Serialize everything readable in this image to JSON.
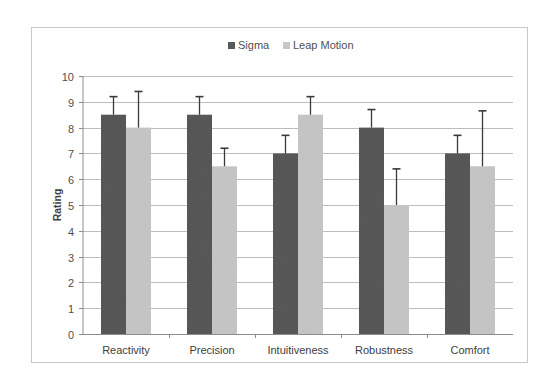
{
  "chart_data": {
    "type": "bar",
    "title": "",
    "xlabel": "",
    "ylabel": "Rating",
    "ylim": [
      0,
      10
    ],
    "yticks": [
      0,
      1,
      2,
      3,
      4,
      5,
      6,
      7,
      8,
      9,
      10
    ],
    "grid": true,
    "legend_position": "top",
    "categories": [
      "Reactivity",
      "Precision",
      "Intuitiveness",
      "Robustness",
      "Comfort"
    ],
    "series": [
      {
        "name": "Sigma",
        "color": "#595959",
        "values": [
          8.5,
          8.5,
          7.0,
          8.0,
          7.0
        ],
        "error_plus": [
          0.7,
          0.7,
          0.7,
          0.7,
          0.7
        ]
      },
      {
        "name": "Leap Motion",
        "color": "#c8c8c8",
        "values": [
          8.0,
          6.5,
          8.5,
          5.0,
          6.5
        ],
        "error_plus": [
          1.4,
          0.7,
          0.7,
          1.4,
          2.15
        ]
      }
    ]
  },
  "legend": {
    "items": [
      {
        "label": "Sigma",
        "color": "#595959"
      },
      {
        "label": "Leap Motion",
        "color": "#c8c8c8"
      }
    ]
  },
  "axis": {
    "ylabel": "Rating"
  }
}
